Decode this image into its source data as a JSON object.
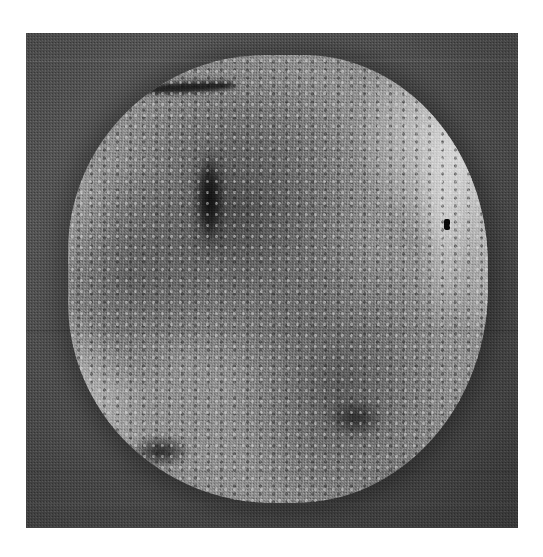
{
  "page": {
    "background_color": "#ffffff",
    "width": 543,
    "height": 557,
    "caption": "",
    "title": ""
  },
  "scan": {
    "panel_label": "grayscale-scan-panel",
    "field_color": "#4a4a4a",
    "specimen_base_color": "#8d8d8d",
    "highlight_color": "#dedede",
    "shadow_color": "#1a1a1a",
    "modality": "grayscale",
    "annotations": [],
    "scale_bar": "",
    "overlay_text": ""
  },
  "features": [
    {
      "name": "bright-region-upper-right",
      "tone": "#dedede"
    },
    {
      "name": "bright-region-lower-left",
      "tone": "#cfcfcf"
    },
    {
      "name": "dark-vertical-streak",
      "tone": "#0a0a0a"
    },
    {
      "name": "dark-horizontal-streak-top",
      "tone": "#080808"
    },
    {
      "name": "dark-blotch-lower-left",
      "tone": "#0c0c0c"
    },
    {
      "name": "dark-blotch-lower-right",
      "tone": "#0e0e0e"
    },
    {
      "name": "punctate-black-dot",
      "tone": "#060606"
    }
  ]
}
